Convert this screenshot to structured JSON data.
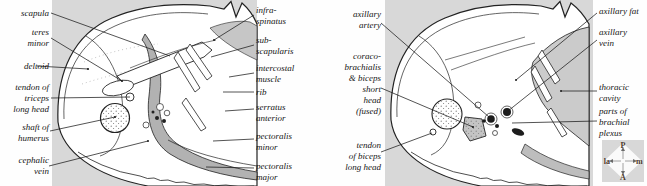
{
  "colors": {
    "panel_bg": "#d8d8d8",
    "ink": "#222222",
    "axilla_shade": "#b2b2b2",
    "cavity_shade": "#cbcbcb",
    "muscle_band_shade": "#bdbdbd",
    "stipple_blob_shade": "#c4c4c4",
    "compass_letter": "#4d3a2c",
    "compass_diamond": "#fafafa"
  },
  "panel_left": {
    "labels_left": [
      {
        "id": "scapula",
        "text": "scapula"
      },
      {
        "id": "teres-minor",
        "text": "teres\nminor"
      },
      {
        "id": "deltoid",
        "text": "deltoid"
      },
      {
        "id": "tendon-of-triceps-long-head",
        "text": "tendon of\ntriceps\nlong head"
      },
      {
        "id": "shaft-of-humerus",
        "text": "shaft of\nhumerus"
      },
      {
        "id": "cephalic-vein",
        "text": "cephalic\nvein"
      }
    ],
    "labels_right": [
      {
        "id": "infraspinatus",
        "text": "infra-\nspinatus"
      },
      {
        "id": "subscapularis",
        "text": "sub-\nscapularis"
      },
      {
        "id": "intercostal-muscle",
        "text": "intercostal\nmuscle"
      },
      {
        "id": "rib",
        "text": "rib"
      },
      {
        "id": "serratus-anterior",
        "text": "serratus\nanterior"
      },
      {
        "id": "pectoralis-minor",
        "text": "pectoralis\nminor"
      },
      {
        "id": "pectoralis-major",
        "text": "pectoralis\nmajor"
      }
    ]
  },
  "panel_right": {
    "labels_left": [
      {
        "id": "axillary-artery",
        "text": "axillary\nartery"
      },
      {
        "id": "coracobrachialis-biceps-short-head",
        "text": "coraco-\nbrachialis\n& biceps\nshort\nhead\n(fused)"
      },
      {
        "id": "tendon-of-biceps-long-head",
        "text": "tendon\nof biceps\nlong head"
      }
    ],
    "labels_right": [
      {
        "id": "axillary-fat",
        "text": "axillary fat"
      },
      {
        "id": "axillary-vein",
        "text": "axillary\nvein"
      },
      {
        "id": "thoracic-cavity",
        "text": "thoracic\ncavity"
      },
      {
        "id": "parts-of-brachial-plexus",
        "text": "parts of\nbrachial\nplexus"
      }
    ]
  },
  "compass": {
    "posterior": "P",
    "anterior": "A",
    "lateral": "la",
    "medial": "m"
  }
}
